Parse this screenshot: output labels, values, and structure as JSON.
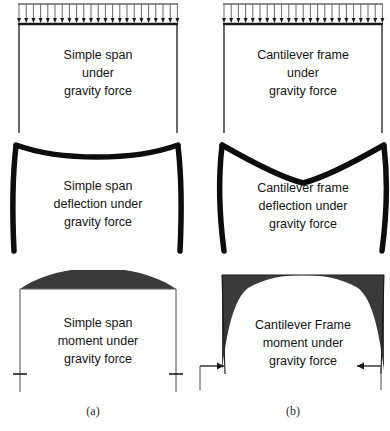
{
  "figure": {
    "captions": [
      {
        "key": "a",
        "text": "(a)"
      },
      {
        "key": "b",
        "text": "(b)"
      }
    ]
  },
  "colors": {
    "line": "#1a1a1a",
    "thin_line": "#4a4a4a",
    "fill_dark": "#3a3a3a",
    "background": "#ffffff",
    "caption": "#2b2b2b"
  },
  "panels": [
    {
      "id": "simple-span-load",
      "column": "a",
      "row": 1,
      "type": "loaded-frame",
      "icon": "distributed-load-icon",
      "load": {
        "kind": "uniform-distributed",
        "arrow_count": 22,
        "direction": "down"
      },
      "lines": [
        "Simple span",
        "under",
        "gravity force"
      ]
    },
    {
      "id": "cantilever-frame-load",
      "column": "b",
      "row": 1,
      "type": "loaded-frame",
      "icon": "distributed-load-icon",
      "load": {
        "kind": "uniform-distributed",
        "arrow_count": 22,
        "direction": "down"
      },
      "lines": [
        "Cantilever frame",
        "under",
        "gravity force"
      ]
    },
    {
      "id": "simple-span-deflection",
      "column": "a",
      "row": 2,
      "type": "deflected-shape",
      "icon": "sagging-beam-icon",
      "shape": {
        "beam": "sag-curve",
        "columns": "bow-inward"
      },
      "lines": [
        "Simple span",
        "deflection under",
        "gravity force"
      ]
    },
    {
      "id": "cantilever-frame-deflection",
      "column": "b",
      "row": 2,
      "type": "deflected-shape",
      "icon": "v-sag-beam-icon",
      "shape": {
        "beam": "v-sag",
        "columns": "splay-outward"
      },
      "lines": [
        "Cantilever frame",
        "deflection under",
        "gravity force"
      ]
    },
    {
      "id": "simple-span-moment",
      "column": "a",
      "row": 3,
      "type": "moment-diagram",
      "icon": "parabolic-moment-icon",
      "diagram": {
        "beam_moment": "positive-parabola-above",
        "column_moment": "none"
      },
      "supports": {
        "kind": "vertical-reaction-tick",
        "count": 2
      },
      "lines": [
        "Simple span",
        "moment under",
        "gravity force"
      ]
    },
    {
      "id": "cantilever-frame-moment",
      "column": "b",
      "row": 3,
      "type": "moment-diagram",
      "icon": "frame-moment-icon",
      "diagram": {
        "beam_moment": "reduced-positive-parabola",
        "column_moment": "tapered-negative"
      },
      "supports": {
        "kind": "horizontal-reaction-arrow",
        "count": 2,
        "direction": "inward"
      },
      "lines": [
        "Cantilever Frame",
        "moment under",
        "gravity force"
      ]
    }
  ]
}
